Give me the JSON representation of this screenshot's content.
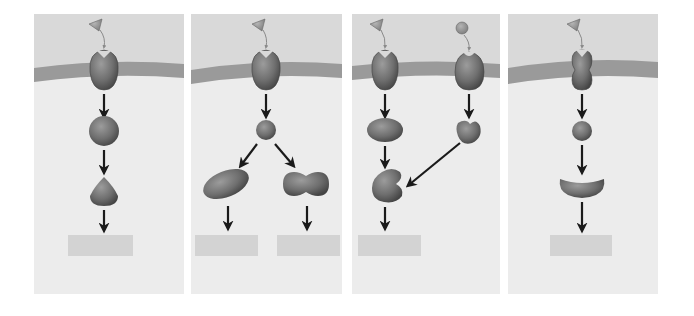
{
  "diagram": {
    "colors": {
      "panel_top": "#d9d9d9",
      "panel_bottom": "#ececec",
      "membrane": "#9a9a9a",
      "molecule": "#7a7a7a",
      "molecule_dark": "#4a4a4a",
      "arrow": "#1a1a1a",
      "label_box": "#d3d3d3"
    },
    "panels": [
      {
        "id": 1,
        "description": "Linear pathway: ligand binds receptor, relay to sphere, then to teardrop, one response",
        "nodes": [
          "triangle-ligand",
          "receptor",
          "sphere",
          "teardrop"
        ],
        "response_labels": [
          ""
        ]
      },
      {
        "id": 2,
        "description": "Divergent pathway: one receptor activates sphere which branches to oval and peanut shapes, two responses",
        "nodes": [
          "triangle-ligand",
          "receptor",
          "small-sphere",
          "oval",
          "peanut"
        ],
        "response_labels": [
          "",
          ""
        ]
      },
      {
        "id": 3,
        "description": "Convergent pathway: two ligands/receptors, ellipse and heart-shaped relay converge to a kidney shape, one response",
        "nodes": [
          "triangle-ligand",
          "circle-ligand",
          "receptor-a",
          "receptor-b",
          "ellipse",
          "heart",
          "kidney"
        ],
        "response_labels": [
          ""
        ]
      },
      {
        "id": 4,
        "description": "Different receptor shape: ligand binds hourglass receptor, sphere relay, crescent, one response",
        "nodes": [
          "triangle-ligand",
          "hourglass-receptor",
          "sphere",
          "crescent"
        ],
        "response_labels": [
          ""
        ]
      }
    ]
  }
}
